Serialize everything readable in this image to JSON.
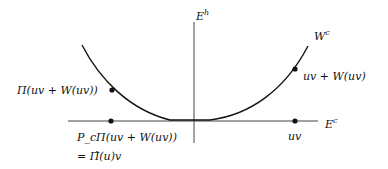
{
  "axes": {
    "vertical_label": "E",
    "vertical_sup": "h",
    "horizontal_label": "E",
    "horizontal_sup": "c"
  },
  "curve": {
    "label": "W",
    "label_sup": "c"
  },
  "points": {
    "left_curve": "Π(uv + W(uv))",
    "left_axis_line1": "P_cΠ(uv + W(uv))",
    "left_axis_line2": "= Π̂(u)v",
    "right_curve": "uv + W(uv)",
    "right_axis": "uv"
  }
}
